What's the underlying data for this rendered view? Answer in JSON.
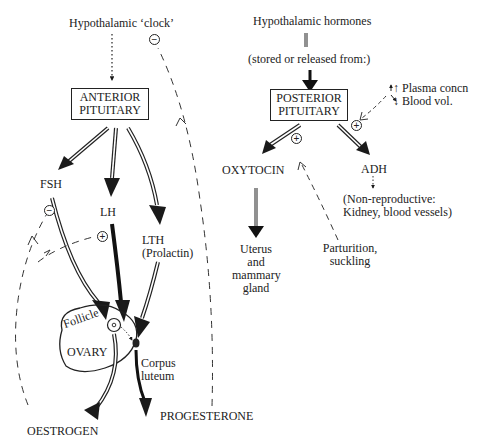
{
  "anterior": {
    "source_label": "Hypothalamic ‘clock’",
    "gland_line1": "ANTERIOR",
    "gland_line2": "PITUITARY",
    "hormones": {
      "fsh": "FSH",
      "lh": "LH",
      "lth_line1": "LTH",
      "lth_line2": "(Prolactin)"
    },
    "ovary": {
      "label": "OVARY",
      "follicle": "Follicle",
      "corpus_line1": "Corpus",
      "corpus_line2": "luteum"
    },
    "outputs": {
      "oestrogen": "OESTROGEN",
      "progesterone": "PROGESTERONE"
    },
    "feedback_signs": {
      "clock_inhibit": "−",
      "fsh_inhibit": "−",
      "lh_stimulate": "+"
    }
  },
  "posterior": {
    "source_label": "Hypothalamic hormones",
    "stored_label": "(stored or released from:)",
    "gland_line1": "POSTERIOR",
    "gland_line2": "PITUITARY",
    "stimulus": {
      "line1": "↑ Plasma concn",
      "line2": "↓ Blood vol."
    },
    "oxytocin": "OXYTOCIN",
    "oxytocin_target": [
      "Uterus",
      "and",
      "mammary",
      "gland"
    ],
    "parturition": [
      "Parturition,",
      "suckling"
    ],
    "adh": "ADH",
    "adh_target_line1": "(Non-reproductive:",
    "adh_target_line2": "Kidney, blood vessels)",
    "signs": {
      "adh_stimulate": "+",
      "oxytocin_stimulate": "+"
    }
  }
}
